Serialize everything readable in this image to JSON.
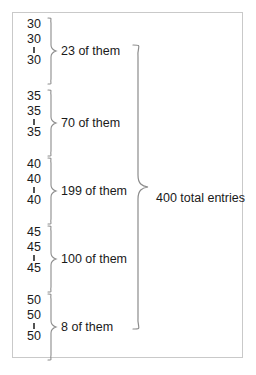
{
  "diagram": {
    "type": "brace-grouping",
    "title": "",
    "frame_color": "#c9c9c9",
    "text_color": "#1a1a1a",
    "brace_color": "#8c8c8c",
    "groups": [
      {
        "value": "30",
        "value_first": "30",
        "value_second": "30",
        "value_last": "30",
        "count": 23,
        "label": "23 of them"
      },
      {
        "value": "35",
        "value_first": "35",
        "value_second": "35",
        "value_last": "35",
        "count": 70,
        "label": "70 of them"
      },
      {
        "value": "40",
        "value_first": "40",
        "value_second": "40",
        "value_last": "40",
        "count": 199,
        "label": "199 of them"
      },
      {
        "value": "45",
        "value_first": "45",
        "value_second": "45",
        "value_last": "45",
        "count": 100,
        "label": "100 of them"
      },
      {
        "value": "50",
        "value_first": "50",
        "value_second": "50",
        "value_last": "50",
        "count": 8,
        "label": "8 of them"
      }
    ],
    "total": {
      "count": 400,
      "label": "400 total entries"
    }
  }
}
